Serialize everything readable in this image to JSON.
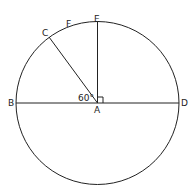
{
  "diagram": {
    "points": {
      "A": "A",
      "B": "B",
      "C": "C",
      "D": "D",
      "E": "E",
      "F": "F"
    },
    "angle_label": "60°",
    "right_angle_marker": true
  }
}
